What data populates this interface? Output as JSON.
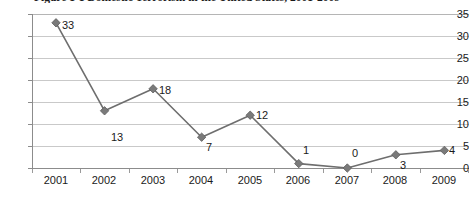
{
  "figure": {
    "title": "Figure 1-1   Domestic Terrorism in the United States, 2001-2009"
  },
  "chart_data": {
    "type": "line",
    "title": "Figure 1-1   Domestic Terrorism in the United States, 2001-2009",
    "xlabel": "",
    "ylabel": "",
    "categories": [
      "2001",
      "2002",
      "2003",
      "2004",
      "2005",
      "2006",
      "2007",
      "2008",
      "2009"
    ],
    "values": [
      33,
      13,
      18,
      7,
      12,
      1,
      0,
      3,
      4
    ],
    "point_labels": [
      "33",
      "13",
      "18",
      "7",
      "12",
      "1",
      "0",
      "3",
      "4"
    ],
    "yticks": [
      "0",
      "5",
      "10",
      "15",
      "20",
      "25",
      "30",
      "35"
    ],
    "ylim": [
      0,
      35
    ],
    "grid": true,
    "legend": "none",
    "marker": "diamond",
    "line_color": "#6e6e6e",
    "marker_color": "#7a7a7a",
    "grid_color": "#c9c9c9",
    "axis_color": "#8c8c8c",
    "background": "#ffffff"
  }
}
